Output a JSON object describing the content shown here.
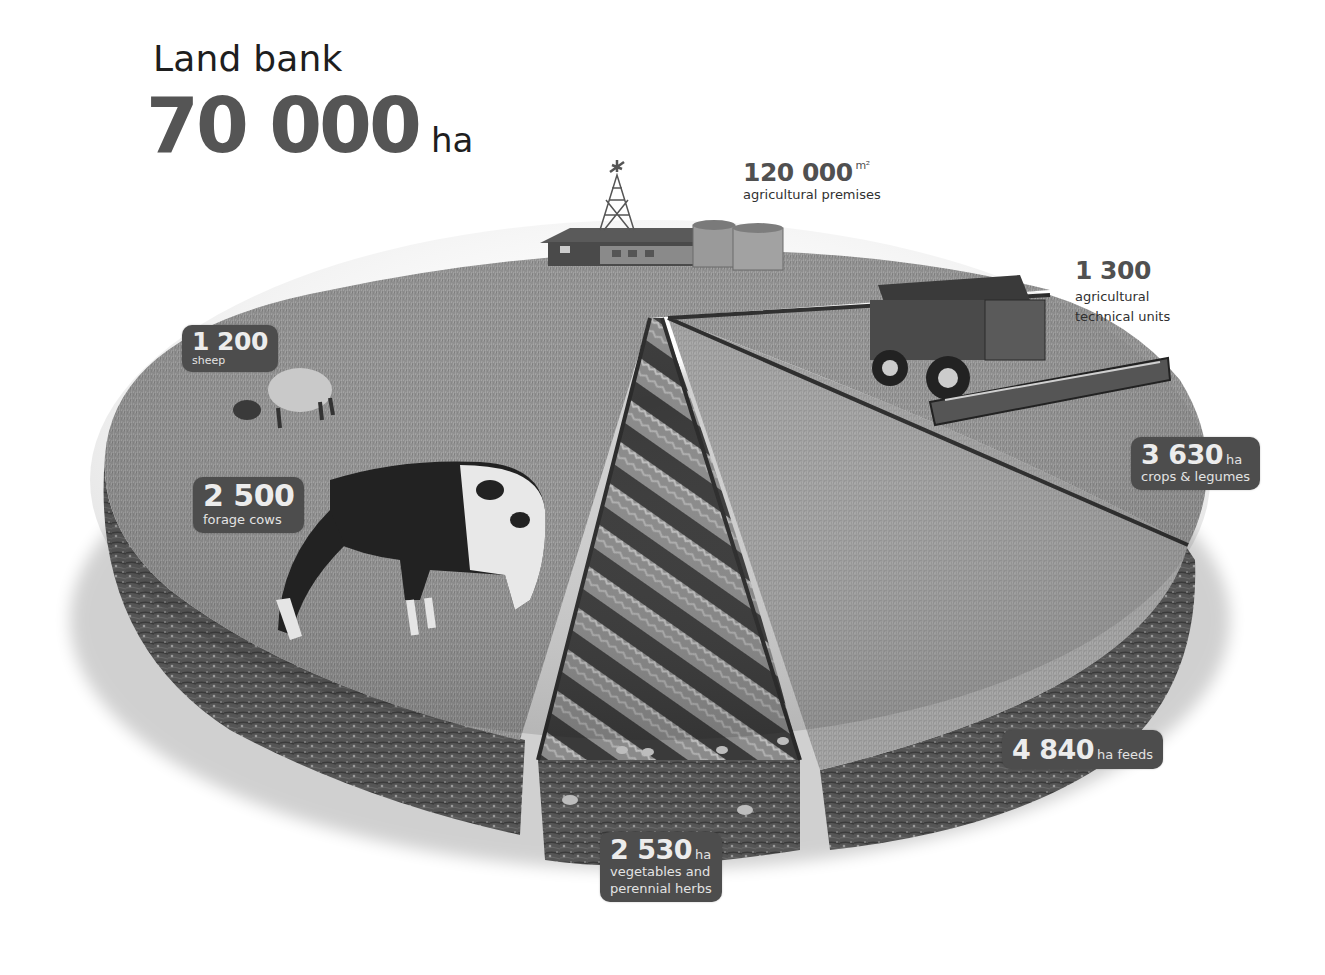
{
  "header": {
    "label": "Land bank",
    "value": "70 000",
    "unit": "ha"
  },
  "callouts": {
    "premises": {
      "value": "120 000",
      "unit": "m²",
      "description": "agricultural premises"
    },
    "machinery": {
      "value": "1 300",
      "description_line1": "agricultural",
      "description_line2": "technical units"
    },
    "sheep": {
      "value": "1 200",
      "description": "sheep"
    },
    "cows": {
      "value": "2 500",
      "description": "forage cows"
    },
    "crops": {
      "value": "3 630",
      "unit": "ha",
      "description": "crops & legumes"
    },
    "feeds": {
      "value": "4 840",
      "unit": "ha feeds"
    },
    "vegetables": {
      "value": "2 530",
      "unit": "ha",
      "description_line1": "vegetables and",
      "description_line2": "perennial herbs"
    }
  },
  "illustration": {
    "objects": [
      "farm-buildings",
      "windmill",
      "grain-silos",
      "combine-harvester",
      "sheep",
      "cow",
      "vegetable-rows",
      "soil-layer"
    ]
  },
  "colors": {
    "tag_background": "#4d4d4d",
    "tag_text": "#e9e9e9",
    "headline_number": "#555555",
    "grass": "#8f8f8f",
    "soil": "#4a4a4a"
  }
}
